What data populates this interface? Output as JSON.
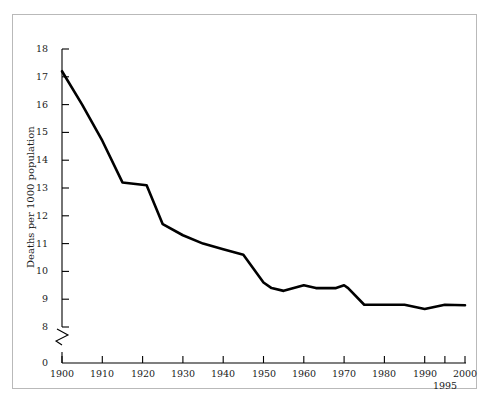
{
  "figure": {
    "border_color": "#b9b9b9",
    "background": "#ffffff",
    "line_color": "#000000"
  },
  "axes": {
    "y_label": "Deaths per 1000 population",
    "y_ticks": [
      "18",
      "17",
      "16",
      "15",
      "14",
      "13",
      "12",
      "11",
      "10",
      "9",
      "8"
    ],
    "y_zero_label": "0",
    "x_ticks": [
      "1900",
      "1910",
      "1920",
      "1930",
      "1940",
      "1950",
      "1960",
      "1970",
      "1980",
      "1990",
      "2000"
    ],
    "x_extra_tick": "1995"
  },
  "chart_data": {
    "type": "line",
    "title": "",
    "xlabel": "",
    "ylabel": "Deaths per 1000 population",
    "xlim": [
      1900,
      2000
    ],
    "ylim": [
      8,
      18
    ],
    "grid": false,
    "legend": null,
    "y_axis_break": true,
    "y_break_baseline": 0,
    "x_tick_values": [
      1900,
      1910,
      1920,
      1930,
      1940,
      1950,
      1960,
      1970,
      1980,
      1990,
      1995,
      2000
    ],
    "y_tick_values": [
      8,
      9,
      10,
      11,
      12,
      13,
      14,
      15,
      16,
      17,
      18
    ],
    "series": [
      {
        "name": "Death rate",
        "x": [
          1900,
          1905,
          1910,
          1915,
          1921,
          1925,
          1930,
          1935,
          1940,
          1945,
          1950,
          1952,
          1955,
          1960,
          1963,
          1968,
          1970,
          1971,
          1975,
          1980,
          1985,
          1990,
          1995,
          2000
        ],
        "values": [
          17.2,
          16.0,
          14.7,
          13.2,
          13.1,
          11.7,
          11.3,
          11.0,
          10.8,
          10.6,
          9.6,
          9.4,
          9.3,
          9.5,
          9.4,
          9.4,
          9.5,
          9.4,
          8.8,
          8.8,
          8.8,
          8.65,
          8.8,
          8.78
        ]
      }
    ]
  }
}
